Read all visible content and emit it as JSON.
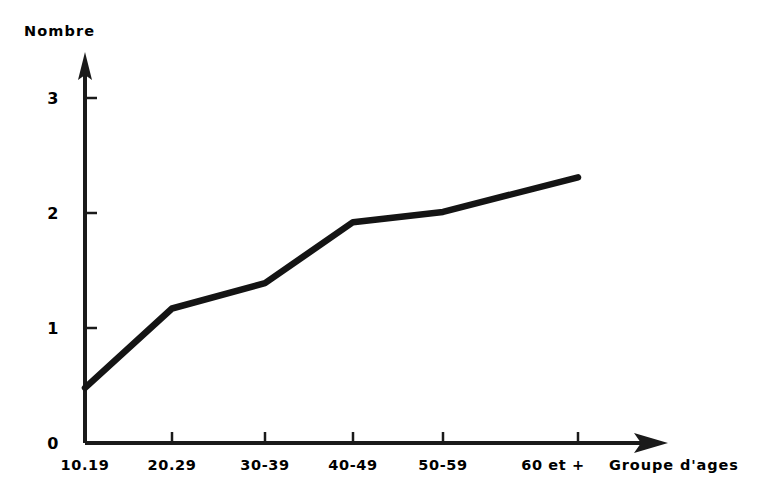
{
  "chart_data": {
    "type": "line",
    "title": "",
    "ylabel": "Nombre",
    "xlabel": "Groupe d'ages",
    "categories": [
      "10.19",
      "20.29",
      "30-39",
      "40-49",
      "50-59",
      "60 et +"
    ],
    "values": [
      0.48,
      1.17,
      1.39,
      1.92,
      2.01,
      2.31
    ],
    "series": [
      {
        "name": "Nombre",
        "values": [
          0.48,
          1.17,
          1.39,
          1.92,
          2.01,
          2.31
        ]
      }
    ],
    "ylim": [
      0,
      3
    ],
    "yticks": [
      "0",
      "1",
      "2",
      "3"
    ],
    "ytick_values": [
      0,
      1,
      2,
      3
    ],
    "grid": false,
    "legend": false,
    "line_color": "#141414",
    "axis_color": "#1a1a1a",
    "background": "#ffffff",
    "x_axis_arrow": true,
    "y_axis_arrow": true,
    "annotations": []
  },
  "axes": {
    "y_title": "Nombre",
    "x_title": "Groupe d'ages",
    "y_ticks": [
      {
        "label": "3",
        "value": 3
      },
      {
        "label": "2",
        "value": 2
      },
      {
        "label": "1",
        "value": 1
      },
      {
        "label": "0",
        "value": 0
      }
    ],
    "x_ticks": [
      {
        "label": "10.19",
        "value": 0
      },
      {
        "label": "20.29",
        "value": 1
      },
      {
        "label": "30-39",
        "value": 2
      },
      {
        "label": "40-49",
        "value": 3
      },
      {
        "label": "50-59",
        "value": 4
      },
      {
        "label": "60 et +",
        "value": 5
      }
    ]
  }
}
